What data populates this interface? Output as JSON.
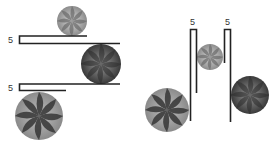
{
  "diagram": {
    "colors": {
      "bar": "#222222",
      "label": "#333333",
      "candy_light": "#b5b5b5",
      "candy_dark": "#4a4a4a",
      "background": "#ffffff"
    },
    "left_panel": {
      "brackets": [
        {
          "label": "5",
          "orientation": "horizontal",
          "x": 19,
          "y_top": 36,
          "y_bottom": 43,
          "top_end": 87,
          "bottom_end": 120
        },
        {
          "label": "5",
          "orientation": "horizontal",
          "x": 19,
          "y_top": 84,
          "y_bottom": 90,
          "top_end": 120,
          "bottom_end": 66
        }
      ],
      "candies": [
        {
          "name": "small-candy-top",
          "cx": 72,
          "cy": 21,
          "r": 15,
          "shade": "light"
        },
        {
          "name": "medium-candy-middle",
          "cx": 101,
          "cy": 64,
          "r": 20,
          "shade": "dark"
        },
        {
          "name": "large-candy-bottom",
          "cx": 39,
          "cy": 116,
          "r": 24,
          "shade": "striped"
        }
      ]
    },
    "right_panel": {
      "brackets": [
        {
          "label": "5",
          "orientation": "vertical",
          "y": 29,
          "x_left": 190,
          "x_right": 196,
          "left_end": 121,
          "right_end": 93
        },
        {
          "label": "5",
          "orientation": "vertical",
          "y": 29,
          "x_left": 224,
          "x_right": 230,
          "left_end": 63,
          "right_end": 122
        }
      ],
      "candies": [
        {
          "name": "small-candy-center",
          "cx": 210,
          "cy": 57,
          "r": 13,
          "shade": "light"
        },
        {
          "name": "large-candy-left",
          "cx": 167,
          "cy": 110,
          "r": 22,
          "shade": "striped"
        },
        {
          "name": "medium-candy-right",
          "cx": 250,
          "cy": 95,
          "r": 19,
          "shade": "dark"
        }
      ]
    }
  }
}
